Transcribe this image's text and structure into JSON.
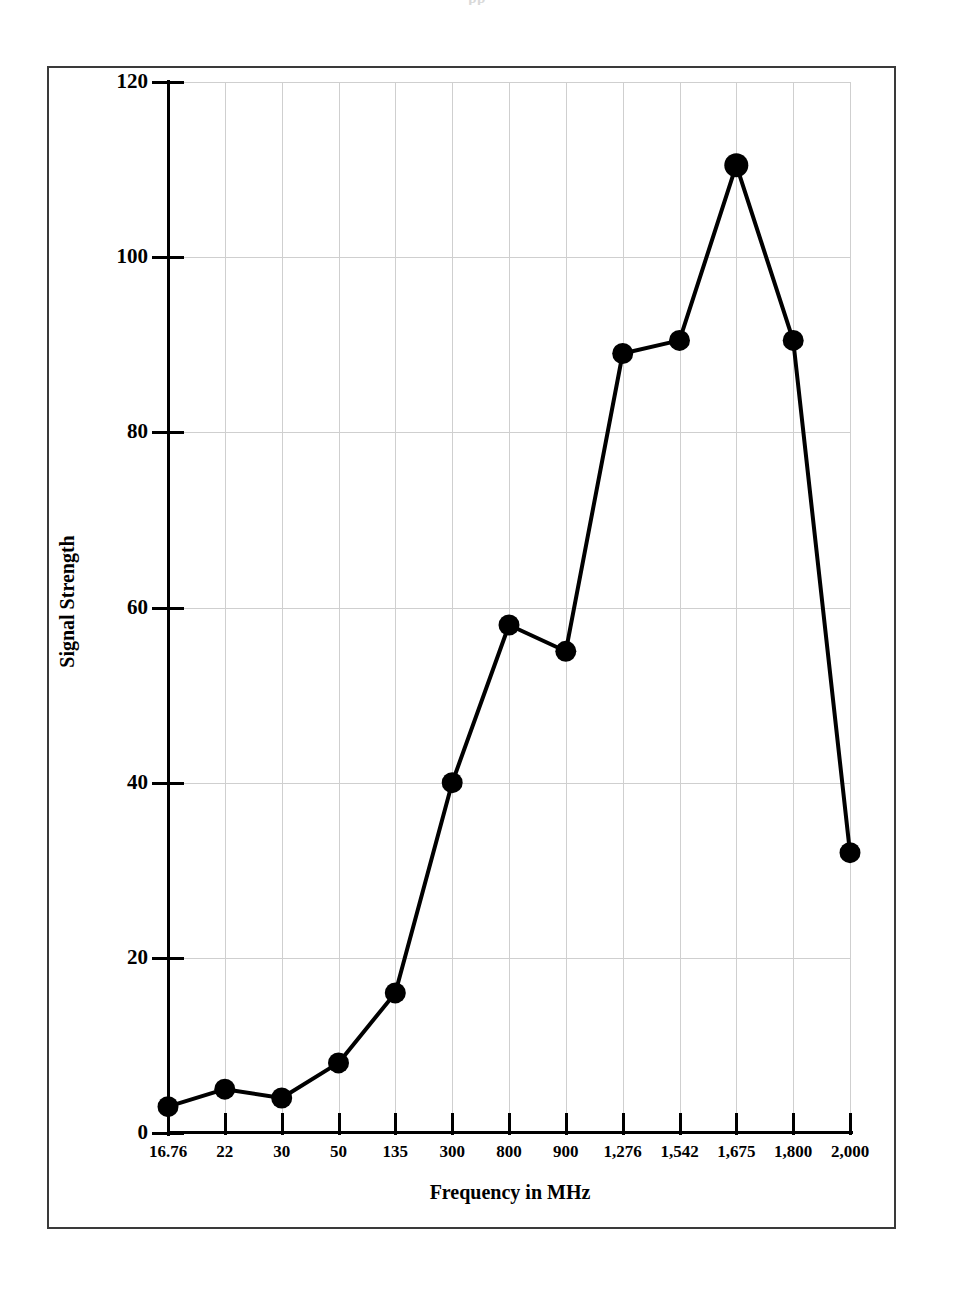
{
  "page": {
    "top_fragment": "pp"
  },
  "chart_data": {
    "type": "line",
    "title": "",
    "subtitle": "",
    "xlabel": "Frequency in MHz",
    "ylabel": "Signal Strength",
    "categories": [
      "16.76",
      "22",
      "30",
      "50",
      "135",
      "300",
      "800",
      "900",
      "1,276",
      "1,542",
      "1,675",
      "1,800",
      "2,000"
    ],
    "values": [
      3,
      5,
      4,
      8,
      16,
      40,
      58,
      55,
      89,
      90.5,
      110.5,
      90.5,
      32
    ],
    "series": [
      {
        "name": "Signal Strength",
        "values": [
          3,
          5,
          4,
          8,
          16,
          40,
          58,
          55,
          89,
          90.5,
          110.5,
          90.5,
          32
        ]
      }
    ],
    "ylim": [
      0,
      120
    ],
    "ytick_labels": [
      "0",
      "20",
      "40",
      "60",
      "80",
      "100",
      "120"
    ],
    "ytick_values": [
      0,
      20,
      40,
      60,
      80,
      100,
      120
    ],
    "grid": true,
    "legend_position": "none",
    "line_color": "#000000",
    "marker_color": "#000000",
    "marker_shape": "circle",
    "grid_color": "#cfcfcf",
    "axis_color": "#000000",
    "frame_color": "#3a3a3a",
    "background_color": "#ffffff"
  }
}
